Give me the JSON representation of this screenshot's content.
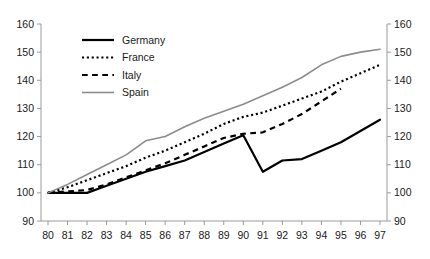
{
  "chart_data": {
    "type": "line",
    "title": "",
    "subtitle": "",
    "xlabel": "",
    "ylabel": "",
    "x": [
      80,
      81,
      82,
      83,
      84,
      85,
      86,
      87,
      88,
      89,
      90,
      91,
      92,
      93,
      94,
      95,
      96,
      97
    ],
    "x_tick_labels": [
      "80",
      "81",
      "82",
      "83",
      "84",
      "85",
      "86",
      "87",
      "88",
      "89",
      "90",
      "91",
      "92",
      "93",
      "94",
      "95",
      "96",
      "97"
    ],
    "y_tick_labels": [
      "90",
      "100",
      "110",
      "120",
      "130",
      "140",
      "150",
      "160"
    ],
    "y_ticks": [
      90,
      100,
      110,
      120,
      130,
      140,
      150,
      160
    ],
    "xlim": [
      80,
      97
    ],
    "ylim": [
      90,
      160
    ],
    "grid": false,
    "right_axis": true,
    "right_axis_tick_labels": [
      "90",
      "100",
      "110",
      "120",
      "130",
      "140",
      "150",
      "160"
    ],
    "legend_position": "top-left-inside",
    "series": [
      {
        "name": "Germany",
        "style": "solid",
        "color": "#000000",
        "width": 2.2,
        "x": [
          80,
          81,
          82,
          83,
          84,
          85,
          86,
          87,
          88,
          89,
          90,
          91,
          92,
          93,
          94,
          95,
          96,
          97
        ],
        "values": [
          100,
          100,
          100,
          102.5,
          105,
          107.5,
          109.5,
          111.5,
          114.5,
          117.5,
          120.5,
          107.5,
          111.5,
          112,
          115,
          118,
          122,
          126
        ]
      },
      {
        "name": "France",
        "style": "dotted",
        "color": "#000000",
        "width": 2.2,
        "x": [
          80,
          81,
          82,
          83,
          84,
          85,
          86,
          87,
          88,
          89,
          90,
          91,
          92,
          93,
          94,
          95,
          96,
          97
        ],
        "values": [
          100,
          102,
          104.5,
          107,
          109.5,
          112.5,
          115,
          118,
          121,
          124.5,
          127,
          128.5,
          131,
          133.5,
          136,
          139.5,
          142.5,
          145.5
        ]
      },
      {
        "name": "Italy",
        "style": "dashed",
        "color": "#000000",
        "width": 2.2,
        "x": [
          80,
          81,
          82,
          83,
          84,
          85,
          86,
          87,
          88,
          89,
          90,
          91,
          92,
          93,
          94,
          95
        ],
        "values": [
          100,
          100.5,
          101,
          103,
          105.5,
          108,
          110.5,
          113.5,
          116.5,
          119.5,
          121,
          121.5,
          124.5,
          128,
          132.5,
          137
        ]
      },
      {
        "name": "Spain",
        "style": "solid",
        "color": "#8c8c8c",
        "width": 1.6,
        "x": [
          80,
          81,
          82,
          83,
          84,
          85,
          86,
          87,
          88,
          89,
          90,
          91,
          92,
          93,
          94,
          95,
          96,
          97
        ],
        "values": [
          100,
          103,
          106.5,
          110,
          113.5,
          118.5,
          120,
          123.5,
          126.5,
          129,
          131.5,
          134.5,
          137.5,
          141,
          145.5,
          148.5,
          150,
          151
        ]
      }
    ]
  }
}
